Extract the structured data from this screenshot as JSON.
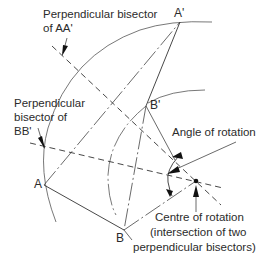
{
  "diagram": {
    "type": "geometric-construction",
    "points": [
      {
        "name": "A",
        "label": "A"
      },
      {
        "name": "B",
        "label": "B"
      },
      {
        "name": "A_prime",
        "label": "A'"
      },
      {
        "name": "B_prime",
        "label": "B'"
      }
    ],
    "labels": {
      "bisector_aa_line1": "Perpendicular bisector",
      "bisector_aa_line2": "of AA'",
      "bisector_bb_line1": "Perpendicular",
      "bisector_bb_line2": "bisector of",
      "bisector_bb_line3": "BB'",
      "angle": "Angle of rotation",
      "centre_line1": "Centre of rotation",
      "centre_line2": "(intersection of two",
      "centre_line3": "perpendicular bisectors)"
    },
    "colors": {
      "line": "#3a3a3a",
      "text": "#2b2b2b",
      "background": "#ffffff"
    }
  }
}
